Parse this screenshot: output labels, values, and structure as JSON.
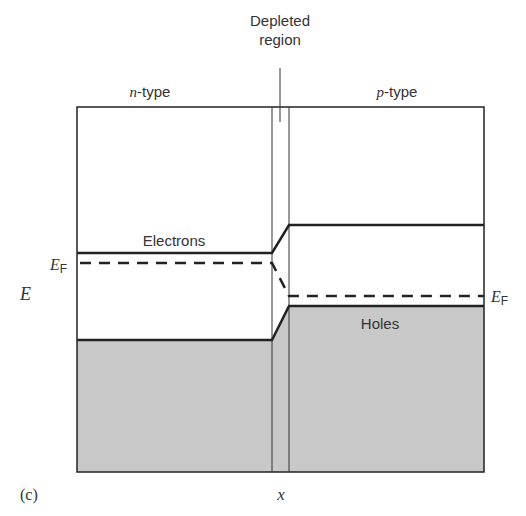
{
  "figure": {
    "panel_label": "(c)",
    "x_axis_label": "x",
    "y_axis_label": "E",
    "region_left_label": "n-type",
    "region_left_italic": "n",
    "region_left_suffix": "-type",
    "region_right_label": "p-type",
    "region_right_italic": "p",
    "region_right_suffix": "-type",
    "depletion_label_line1": "Depleted",
    "depletion_label_line2": "region",
    "conduction_band_label": "Electrons",
    "valence_band_label": "Holes",
    "fermi_left_label": "E",
    "fermi_left_sub": "F",
    "fermi_right_label": "E",
    "fermi_right_sub": "F"
  },
  "colors": {
    "line": "#222222",
    "fill_valence": "#c8c8c8",
    "background": "#ffffff",
    "text": "#333333"
  }
}
